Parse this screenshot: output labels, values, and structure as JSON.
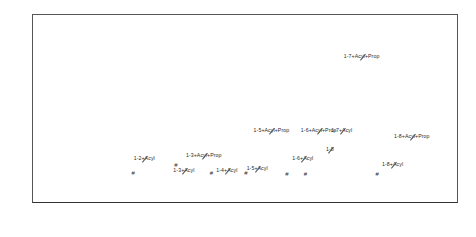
{
  "axes": {
    "y_title": "Relative Abundance",
    "y_ticks": [
      "100",
      "80",
      "60",
      "40",
      "20"
    ],
    "x_ticks": [
      "200",
      "400",
      "600",
      "800",
      "1000",
      "1200",
      "1400"
    ],
    "x_title": "m/z"
  },
  "chart_data": {
    "type": "bar",
    "title": "",
    "subtitle": "",
    "xlabel": "m/z",
    "ylabel": "Relative Abundance",
    "xlim": [
      180,
      1470
    ],
    "ylim": [
      0,
      100
    ],
    "grid": false,
    "legend": "none",
    "peaks": [
      {
        "mz": 196,
        "intensity": 11
      },
      {
        "mz": 201,
        "intensity": 7
      },
      {
        "mz": 205,
        "intensity": 14
      },
      {
        "mz": 209,
        "intensity": 6
      },
      {
        "mz": 213,
        "intensity": 18
      },
      {
        "mz": 217,
        "intensity": 9
      },
      {
        "mz": 221,
        "intensity": 13
      },
      {
        "mz": 225,
        "intensity": 7
      },
      {
        "mz": 229,
        "intensity": 16
      },
      {
        "mz": 233,
        "intensity": 10
      },
      {
        "mz": 237,
        "intensity": 6
      },
      {
        "mz": 241,
        "intensity": 12
      },
      {
        "mz": 245,
        "intensity": 8
      },
      {
        "mz": 249,
        "intensity": 15
      },
      {
        "mz": 253,
        "intensity": 9
      },
      {
        "mz": 257,
        "intensity": 5
      },
      {
        "mz": 261,
        "intensity": 11
      },
      {
        "mz": 265,
        "intensity": 7
      },
      {
        "mz": 269,
        "intensity": 13
      },
      {
        "mz": 273,
        "intensity": 6
      },
      {
        "mz": 277,
        "intensity": 10
      },
      {
        "mz": 281,
        "intensity": 8
      },
      {
        "mz": 285,
        "intensity": 5
      },
      {
        "mz": 289,
        "intensity": 9
      },
      {
        "mz": 293,
        "intensity": 7
      },
      {
        "mz": 297,
        "intensity": 4
      },
      {
        "mz": 301,
        "intensity": 8
      },
      {
        "mz": 305,
        "intensity": 6
      },
      {
        "mz": 309,
        "intensity": 10
      },
      {
        "mz": 313,
        "intensity": 5
      },
      {
        "mz": 317,
        "intensity": 7
      },
      {
        "mz": 321,
        "intensity": 4
      },
      {
        "mz": 325,
        "intensity": 100,
        "label": "base-peak"
      },
      {
        "mz": 331,
        "intensity": 6
      },
      {
        "mz": 337,
        "intensity": 4
      },
      {
        "mz": 343,
        "intensity": 7
      },
      {
        "mz": 349,
        "intensity": 3
      },
      {
        "mz": 355,
        "intensity": 5
      },
      {
        "mz": 361,
        "intensity": 42
      },
      {
        "mz": 367,
        "intensity": 4
      },
      {
        "mz": 373,
        "intensity": 3
      },
      {
        "mz": 379,
        "intensity": 5
      },
      {
        "mz": 385,
        "intensity": 3
      },
      {
        "mz": 391,
        "intensity": 4
      },
      {
        "mz": 397,
        "intensity": 2
      },
      {
        "mz": 404,
        "intensity": 5
      },
      {
        "mz": 411,
        "intensity": 3
      },
      {
        "mz": 418,
        "intensity": 8
      },
      {
        "mz": 425,
        "intensity": 3
      },
      {
        "mz": 432,
        "intensity": 4
      },
      {
        "mz": 440,
        "intensity": 2
      },
      {
        "mz": 448,
        "intensity": 6
      },
      {
        "mz": 455,
        "intensity": 3
      },
      {
        "mz": 462,
        "intensity": 4
      },
      {
        "mz": 470,
        "intensity": 2
      },
      {
        "mz": 478,
        "intensity": 3
      },
      {
        "mz": 486,
        "intensity": 2
      },
      {
        "mz": 494,
        "intensity": 4
      },
      {
        "mz": 502,
        "intensity": 2
      },
      {
        "mz": 512,
        "intensity": 10,
        "label": "1-2+Acyl"
      },
      {
        "mz": 520,
        "intensity": 3
      },
      {
        "mz": 530,
        "intensity": 2
      },
      {
        "mz": 540,
        "intensity": 3
      },
      {
        "mz": 550,
        "intensity": 2
      },
      {
        "mz": 560,
        "intensity": 4
      },
      {
        "mz": 570,
        "intensity": 2
      },
      {
        "mz": 580,
        "intensity": 3
      },
      {
        "mz": 592,
        "intensity": 2
      },
      {
        "mz": 604,
        "intensity": 3
      },
      {
        "mz": 616,
        "intensity": 2
      },
      {
        "mz": 628,
        "intensity": 11,
        "label": "1-3+Acyl"
      },
      {
        "mz": 640,
        "intensity": 2
      },
      {
        "mz": 652,
        "intensity": 3
      },
      {
        "mz": 664,
        "intensity": 2
      },
      {
        "mz": 676,
        "intensity": 9,
        "label": "1-3+Acyl+Prop"
      },
      {
        "mz": 690,
        "intensity": 2
      },
      {
        "mz": 704,
        "intensity": 3
      },
      {
        "mz": 718,
        "intensity": 2
      },
      {
        "mz": 732,
        "intensity": 3
      },
      {
        "mz": 746,
        "intensity": 8,
        "label": "1-4+Acyl"
      },
      {
        "mz": 760,
        "intensity": 2
      },
      {
        "mz": 775,
        "intensity": 3
      },
      {
        "mz": 790,
        "intensity": 2
      },
      {
        "mz": 805,
        "intensity": 3
      },
      {
        "mz": 820,
        "intensity": 2
      },
      {
        "mz": 838,
        "intensity": 10,
        "label": "1-5+Acyl"
      },
      {
        "mz": 855,
        "intensity": 2
      },
      {
        "mz": 872,
        "intensity": 3
      },
      {
        "mz": 888,
        "intensity": 2
      },
      {
        "mz": 905,
        "intensity": 18,
        "label": "1-5+Acyl+Prop"
      },
      {
        "mz": 922,
        "intensity": 3
      },
      {
        "mz": 940,
        "intensity": 2
      },
      {
        "mz": 958,
        "intensity": 4
      },
      {
        "mz": 975,
        "intensity": 14,
        "label": "1-6+Acyl"
      },
      {
        "mz": 992,
        "intensity": 3
      },
      {
        "mz": 1010,
        "intensity": 22,
        "label": "1-6+Acyl+Prop"
      },
      {
        "mz": 1028,
        "intensity": 3
      },
      {
        "mz": 1046,
        "intensity": 2
      },
      {
        "mz": 1062,
        "intensity": 20,
        "label": "1-8"
      },
      {
        "mz": 1080,
        "intensity": 3
      },
      {
        "mz": 1098,
        "intensity": 28,
        "label": "1-7+Acyl"
      },
      {
        "mz": 1115,
        "intensity": 3
      },
      {
        "mz": 1132,
        "intensity": 4
      },
      {
        "mz": 1150,
        "intensity": 66,
        "label": "1-7+Acyl+Prop"
      },
      {
        "mz": 1168,
        "intensity": 3
      },
      {
        "mz": 1186,
        "intensity": 2
      },
      {
        "mz": 1205,
        "intensity": 4
      },
      {
        "mz": 1225,
        "intensity": 3
      },
      {
        "mz": 1248,
        "intensity": 12,
        "label": "1-8+Acyl"
      },
      {
        "mz": 1268,
        "intensity": 3
      },
      {
        "mz": 1290,
        "intensity": 24,
        "label": "1-8+Acyl+Prop"
      },
      {
        "mz": 1312,
        "intensity": 3
      },
      {
        "mz": 1335,
        "intensity": 2
      },
      {
        "mz": 1358,
        "intensity": 3
      },
      {
        "mz": 1382,
        "intensity": 2
      },
      {
        "mz": 1405,
        "intensity": 2
      },
      {
        "mz": 1430,
        "intensity": 1
      }
    ],
    "annotations": [
      {
        "text": "1-2+Acyl",
        "mz": 520,
        "y": 22
      },
      {
        "text": "1-3+Acyl",
        "mz": 640,
        "y": 16
      },
      {
        "text": "1-3+Acyl+Prop",
        "mz": 700,
        "y": 24
      },
      {
        "text": "1-4+Acyl",
        "mz": 770,
        "y": 16
      },
      {
        "text": "1-5+Acyl",
        "mz": 862,
        "y": 17
      },
      {
        "text": "1-5+Acyl+Prop",
        "mz": 905,
        "y": 37
      },
      {
        "text": "1-6+Acyl",
        "mz": 1000,
        "y": 22
      },
      {
        "text": "1-6+Acyl+Prop",
        "mz": 1048,
        "y": 37
      },
      {
        "text": "1-8",
        "mz": 1082,
        "y": 27
      },
      {
        "text": "1-7+Acyl",
        "mz": 1118,
        "y": 37
      },
      {
        "text": "1-7+Acyl+Prop",
        "mz": 1178,
        "y": 76
      },
      {
        "text": "1-8+Acyl",
        "mz": 1272,
        "y": 19
      },
      {
        "text": "1-8+Acyl+Prop",
        "mz": 1330,
        "y": 34
      }
    ],
    "hash_markers": [
      {
        "mz": 486,
        "y": 14
      },
      {
        "mz": 616,
        "y": 18
      },
      {
        "mz": 723,
        "y": 14
      },
      {
        "mz": 828,
        "y": 14
      },
      {
        "mz": 952,
        "y": 13
      },
      {
        "mz": 1008,
        "y": 13
      },
      {
        "mz": 1225,
        "y": 13
      }
    ]
  }
}
